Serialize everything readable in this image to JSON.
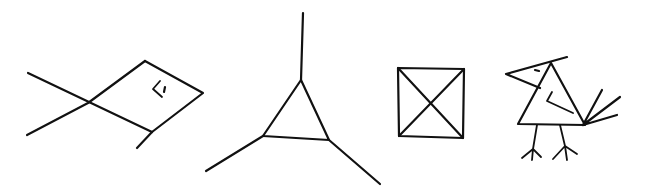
{
  "figure": {
    "description": "Four hand-drawn line sketches",
    "stroke_color": "#111111",
    "background": "#ffffff",
    "items": [
      {
        "label": "fish"
      },
      {
        "label": "triangle with three spokes"
      },
      {
        "label": "square with diagonals"
      },
      {
        "label": "bird"
      }
    ]
  }
}
